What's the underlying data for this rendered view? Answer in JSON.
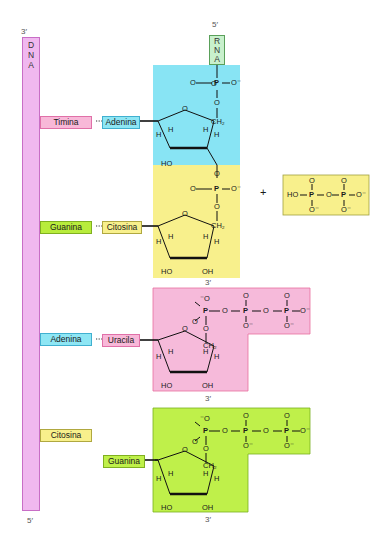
{
  "colors": {
    "dna_strand": "#f0b8ef",
    "dna_border": "#c86ec6",
    "rna_box": "#c8f0cc",
    "rna_border": "#5aa05a",
    "adenine": "#8ee6f4",
    "guanine": "#b8ec3c",
    "cytosine": "#f8f08c",
    "thymine_uracil": "#f8b8d8",
    "block_blue": "#88e4f4",
    "block_yellow": "#f8f08c",
    "block_pink": "#f6bada",
    "block_green": "#bff04a",
    "pyrophosphate_box": "#f8f08c"
  },
  "dna": {
    "letters": [
      "D",
      "N",
      "A"
    ],
    "top_end": "3′",
    "bottom_end": "5′"
  },
  "rna": {
    "letters": [
      "R",
      "N",
      "A"
    ],
    "top_end": "5′"
  },
  "pairs": [
    {
      "dna_base": "Timina",
      "rna_base": "Adenina",
      "connector": "···"
    },
    {
      "dna_base": "Guanina",
      "rna_base": "Citosina",
      "connector": "···"
    },
    {
      "dna_base": "Adenina",
      "rna_base": "Uracila",
      "connector": "···"
    },
    {
      "dna_base": "Citosina",
      "rna_base": "Guanina"
    }
  ],
  "ends": {
    "block2_bottom": "3′",
    "block3_bottom": "3′",
    "block4_bottom": "3′"
  },
  "chem": {
    "phosphate_top": {
      "O_left": "O",
      "P": "P",
      "O_right": "O⁻",
      "O_bottom": "O"
    },
    "ring_O": "O",
    "CH2": "CH₂",
    "H": "H",
    "HO": "HO",
    "OH": "OH",
    "O_minus": "⁻O",
    "O": "O",
    "O_minus_suffix": "O⁻"
  },
  "plus": "+",
  "pyrophosphate": {
    "HO": "HO",
    "P": "P",
    "O": "O",
    "O_minus": "O⁻"
  }
}
